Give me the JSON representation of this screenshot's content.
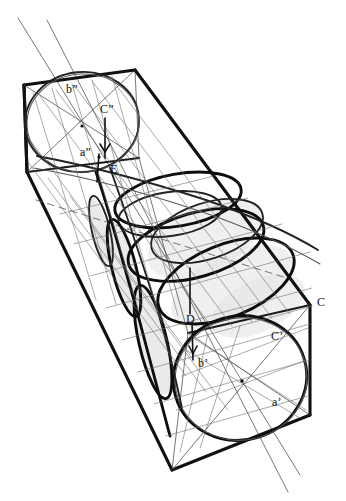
{
  "figure": {
    "medium": "hand-drawn line drawing",
    "background_color": "#ffffff",
    "ink_color": "#111111",
    "construction_line_color": "#555555",
    "shading_color": "#d9d9d9",
    "caption": ""
  },
  "labels": {
    "b_double_prime": "b”",
    "c_double_prime": "C”",
    "a_double_prime": "a”",
    "e": "E",
    "d": "D",
    "b_prime": "b’",
    "c_prime": "C’",
    "c": "C",
    "a_prime": "a’"
  },
  "label_positions": {
    "b_double_prime": {
      "x": 66,
      "y": 83
    },
    "c_double_prime": {
      "x": 100,
      "y": 103
    },
    "a_double_prime": {
      "x": 80,
      "y": 146
    },
    "e": [
      {
        "x": 110,
        "y": 163
      }
    ],
    "d": {
      "x": 186,
      "y": 313
    },
    "b_prime": {
      "x": 198,
      "y": 357
    },
    "c_prime": {
      "x": 271,
      "y": 330
    },
    "c": {
      "x": 317,
      "y": 296
    },
    "a_prime": {
      "x": 272,
      "y": 396
    }
  }
}
